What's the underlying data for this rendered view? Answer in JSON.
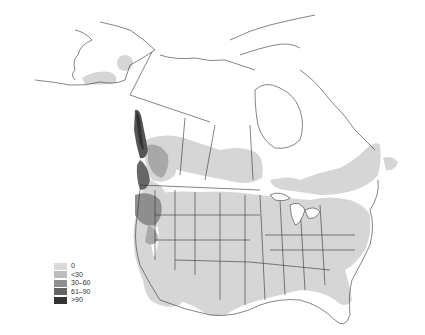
{
  "map": {
    "region": "North America (Alaska, Canada, contiguous United States)",
    "type": "choropleth",
    "boundaries": "state and province borders",
    "fill_colors": {
      "class_0": "#d8d8d8",
      "class_lt30": "#bdbdbd",
      "class_30_60": "#8e8e8e",
      "class_61_90": "#606060",
      "class_gt90": "#2e2e2e"
    }
  },
  "legend": {
    "items": [
      {
        "label": "0",
        "color": "#dadada"
      },
      {
        "label": "<30",
        "color": "#bcbcbc"
      },
      {
        "label": "30–60",
        "color": "#8f8f8f"
      },
      {
        "label": "61–90",
        "color": "#636363"
      },
      {
        "label": ">90",
        "color": "#333333"
      }
    ]
  }
}
